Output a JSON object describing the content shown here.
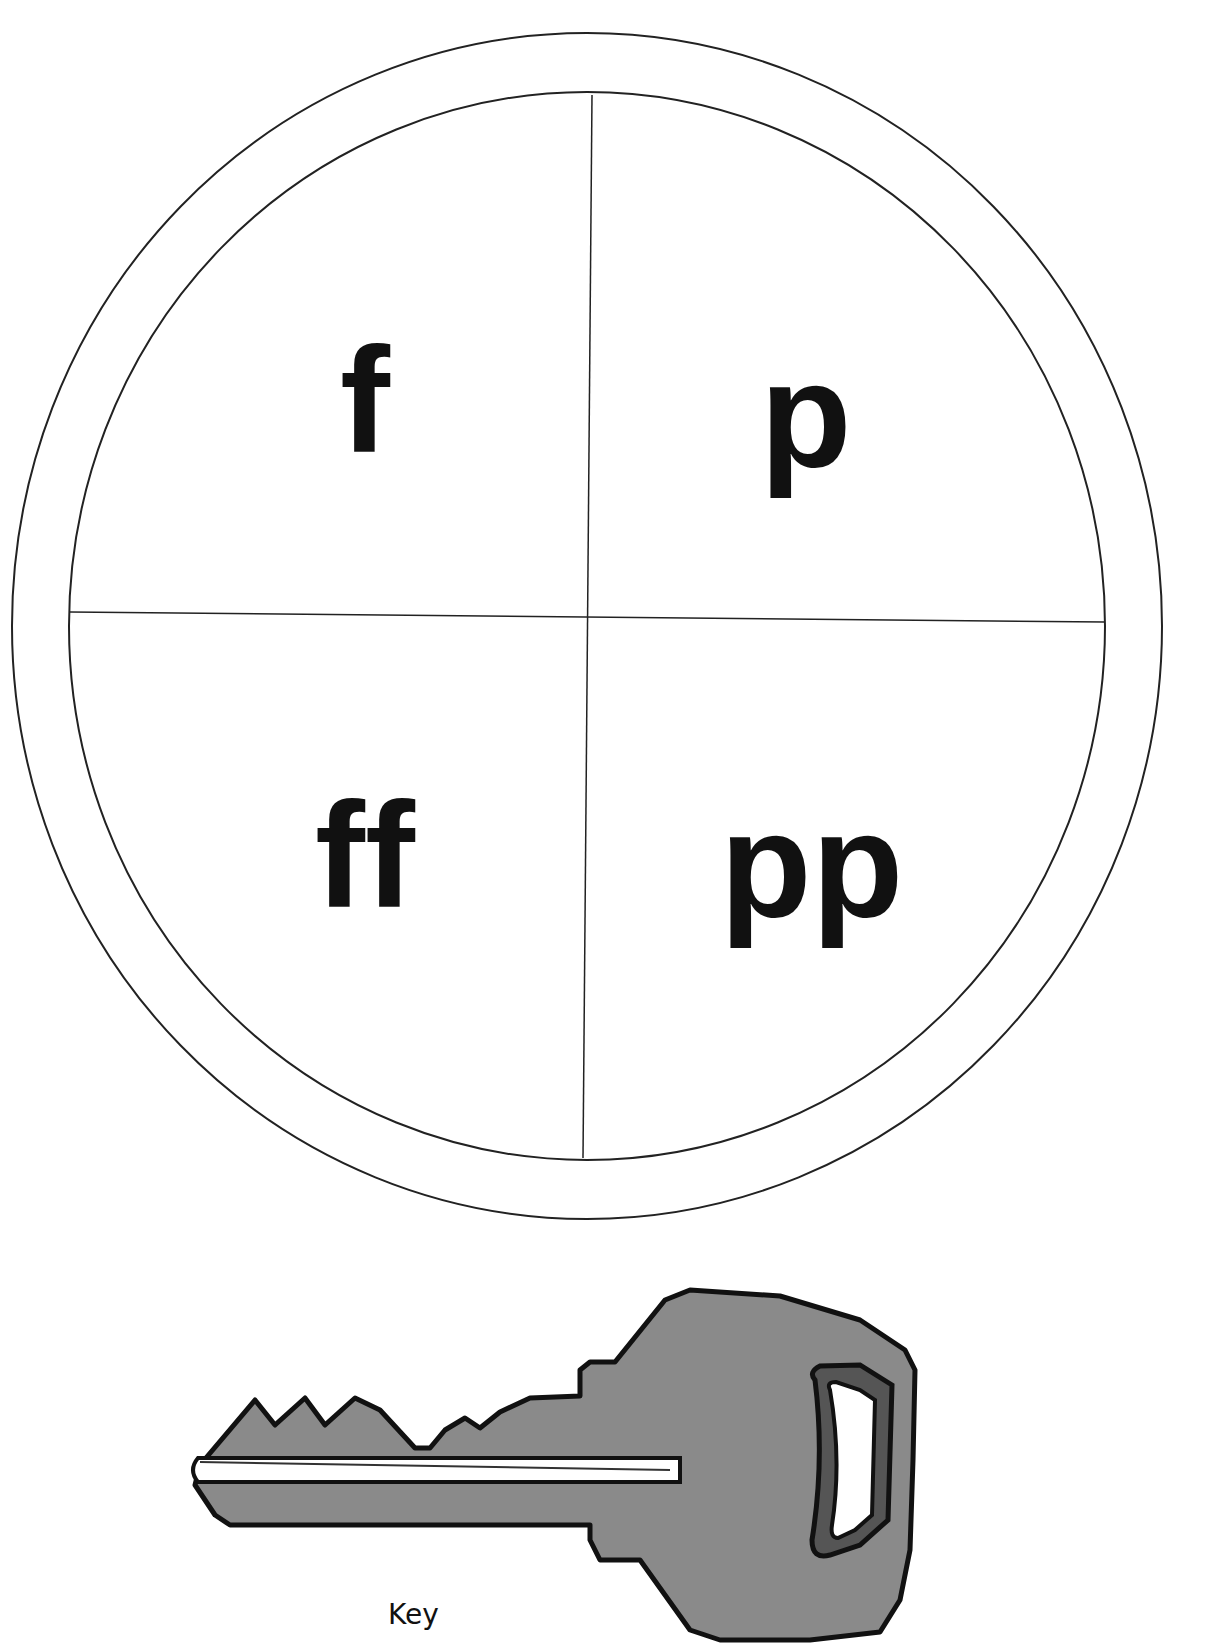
{
  "worksheet": {
    "wheel": {
      "quadrants": [
        {
          "position": "top-left",
          "text": "f"
        },
        {
          "position": "top-right",
          "text": "p"
        },
        {
          "position": "bottom-left",
          "text": "ff"
        },
        {
          "position": "bottom-right",
          "text": "pp"
        }
      ]
    },
    "key_image": {
      "icon": "key-icon",
      "caption": "Key",
      "fill_color": "#8a8a8a",
      "outline_color": "#111111"
    }
  }
}
